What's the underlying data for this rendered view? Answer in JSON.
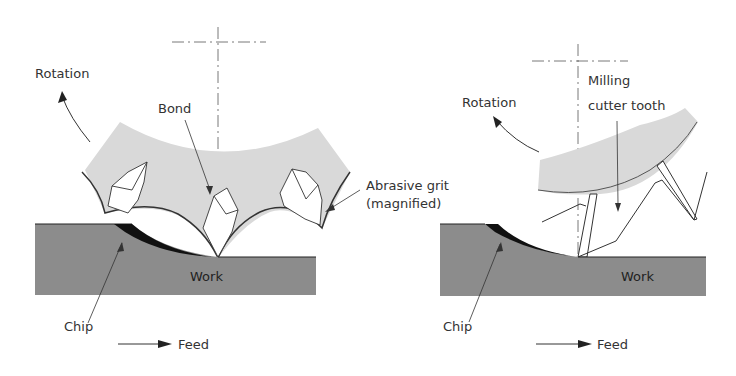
{
  "left_panel": {
    "rotation_label": "Rotation",
    "bond_label": "Bond",
    "abrasive_line1": "Abrasive grit",
    "abrasive_line2": "(magnified)",
    "work_label": "Work",
    "chip_label": "Chip",
    "feed_label": "Feed"
  },
  "right_panel": {
    "rotation_label": "Rotation",
    "milling_line1": "Milling",
    "milling_line2": "cutter tooth",
    "work_label": "Work",
    "chip_label": "Chip",
    "feed_label": "Feed"
  },
  "colors": {
    "wheel": "#d9d9d9",
    "work": "#8c8c8c",
    "chip": "#111111",
    "line": "#333333"
  }
}
